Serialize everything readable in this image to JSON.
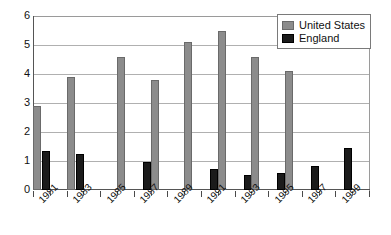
{
  "chart_data": {
    "type": "bar",
    "title": "",
    "xlabel": "",
    "ylabel": "",
    "ylim": [
      0,
      6
    ],
    "ytick_labels": [
      "0",
      "1",
      "2",
      "3",
      "4",
      "5",
      "6"
    ],
    "ytick_values": [
      0,
      1,
      2,
      3,
      4,
      5,
      6
    ],
    "grid": true,
    "legend_position": "top-right",
    "categories": [
      "1981",
      "1982",
      "1983",
      "1984",
      "1985",
      "1986",
      "1987",
      "1988",
      "1989",
      "1990",
      "1991",
      "1992",
      "1993",
      "1994",
      "1995",
      "1996",
      "1997",
      "1998",
      "1999",
      "2000"
    ],
    "tick_labels": [
      "1981",
      "1983",
      "1985",
      "1987",
      "1989",
      "1991",
      "1993",
      "1995",
      "1997",
      "1999"
    ],
    "series": [
      {
        "name": "United States",
        "color": "#8c8c8c",
        "values": [
          2.9,
          0,
          3.9,
          0,
          0,
          4.6,
          0,
          3.8,
          0,
          5.1,
          0,
          5.5,
          0,
          4.6,
          0,
          4.1,
          0,
          0,
          0,
          0
        ]
      },
      {
        "name": "England",
        "color": "#1b1b1b",
        "values": [
          1.35,
          0,
          1.25,
          0,
          0,
          0,
          0.97,
          0,
          0,
          0,
          0.72,
          0,
          0.53,
          0,
          0.6,
          0,
          0.83,
          0,
          1.45,
          0
        ]
      }
    ]
  },
  "legend": {
    "items": [
      {
        "label": "United States",
        "key": "us"
      },
      {
        "label": "England",
        "key": "england"
      }
    ]
  }
}
